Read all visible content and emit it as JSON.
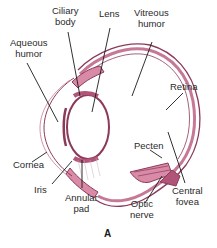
{
  "diagram": {
    "panel_letter": "A",
    "colors": {
      "outline": "#8b3a5a",
      "fill_tissue": "#d98aa6",
      "fill_light": "#f3d2dc",
      "leader_line": "#1a1a1a",
      "text": "#2a2a2a"
    },
    "labels": {
      "ciliary_body": [
        "Ciliary",
        "body"
      ],
      "lens": [
        "Lens"
      ],
      "vitreous_humor": [
        "Vitreous",
        "humor"
      ],
      "aqueous_humor": [
        "Aqueous",
        "humor"
      ],
      "retina": [
        "Retina"
      ],
      "cornea": [
        "Cornea"
      ],
      "pecten": [
        "Pecten"
      ],
      "iris": [
        "Iris"
      ],
      "annular_pad": [
        "Annular",
        "pad"
      ],
      "optic_nerve": [
        "Optic",
        "nerve"
      ],
      "central_fovea": [
        "Central",
        "fovea"
      ]
    }
  }
}
